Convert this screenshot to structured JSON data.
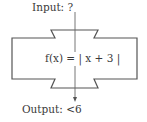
{
  "diagram": {
    "type": "function-machine",
    "input": {
      "label": "Input:",
      "value": "?"
    },
    "function": {
      "name": "f(x)",
      "expression": "f(x) = | x + 3 |"
    },
    "output": {
      "label": "Output:",
      "value": "<6"
    }
  },
  "colors": {
    "stroke": "#555555",
    "text": "#3a3a3a",
    "background": "#ffffff"
  }
}
